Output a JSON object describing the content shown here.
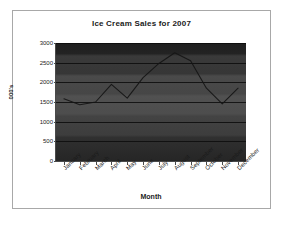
{
  "chart_data": {
    "type": "line",
    "title": "Ice Cream Sales for 2007",
    "xlabel": "Month",
    "ylabel": "000's",
    "categories": [
      "January",
      "February",
      "March",
      "April",
      "May",
      "June",
      "July",
      "August",
      "September",
      "October",
      "November",
      "December"
    ],
    "series": [
      {
        "name": "Ice Cream Sales",
        "values": [
          1580,
          1430,
          1500,
          1950,
          1600,
          2120,
          2480,
          2750,
          2550,
          1850,
          1450,
          1850
        ]
      }
    ],
    "ylim": [
      0,
      3000
    ],
    "yticks": [
      0,
      500,
      1000,
      1500,
      2000,
      2500,
      3000
    ],
    "ytick_labels": [
      "0",
      "500",
      "1000",
      "1500",
      "2000",
      "2500",
      "3000"
    ],
    "grid": true,
    "legend": false,
    "legend_position": "none",
    "plot_background": "#3d3d3d",
    "gridline_color": "#0c0c0c",
    "series_color": "#151515",
    "frame_border_color": "#a8a8a8",
    "page_background": "#ffffff"
  }
}
